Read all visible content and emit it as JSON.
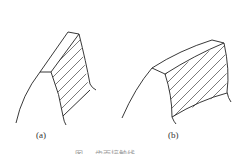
{
  "figures": [
    {
      "id": "a",
      "label": "(a)"
    },
    {
      "id": "b",
      "label": "(b)"
    }
  ],
  "caption": "图 … 齿面接触线"
}
